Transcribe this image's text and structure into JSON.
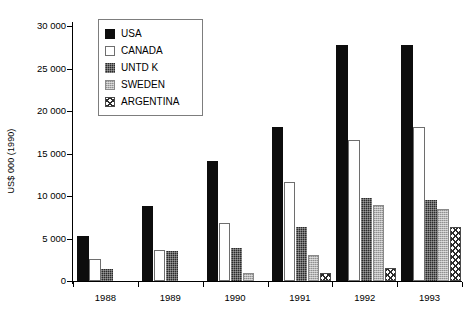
{
  "chart_data": {
    "type": "bar",
    "title": "",
    "xlabel": "",
    "ylabel": "US$ 000 (1990)",
    "categories": [
      "1988",
      "1989",
      "1990",
      "1991",
      "1992",
      "1993"
    ],
    "ylim": [
      0,
      30000
    ],
    "yticks": [
      0,
      5000,
      10000,
      15000,
      20000,
      25000,
      30000
    ],
    "ytick_labels": [
      "0",
      "5 000",
      "10 000",
      "15 000",
      "20 000",
      "25 000",
      "30 000"
    ],
    "grid": false,
    "legend_position": "upper-left-inside",
    "series": [
      {
        "name": "USA",
        "fill": "solid-black",
        "color": "#0d0d0d",
        "values": [
          5300,
          8800,
          14100,
          18100,
          27800,
          27800
        ]
      },
      {
        "name": "CANADA",
        "fill": "white-outline",
        "color": "#ffffff",
        "values": [
          2600,
          3700,
          6800,
          11600,
          16600,
          18100
        ]
      },
      {
        "name": "UNTD K",
        "fill": "dark-stipple",
        "color": "#2a2a2a",
        "values": [
          1400,
          3500,
          3900,
          6400,
          9800,
          9500
        ]
      },
      {
        "name": "SWEDEN",
        "fill": "gray-stipple",
        "color": "#b4b4b4",
        "values": [
          0,
          0,
          900,
          3100,
          9000,
          8500
        ]
      },
      {
        "name": "ARGENTINA",
        "fill": "crosshatch-white",
        "color": "#ffffff",
        "values": [
          0,
          0,
          0,
          1000,
          1500,
          6300
        ]
      }
    ]
  },
  "legend": {
    "items": [
      {
        "label": "USA"
      },
      {
        "label": "CANADA"
      },
      {
        "label": "UNTD K"
      },
      {
        "label": "SWEDEN"
      },
      {
        "label": "ARGENTINA"
      }
    ]
  }
}
